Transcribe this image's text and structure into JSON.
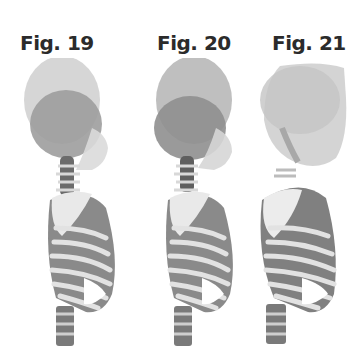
{
  "figures": [
    {
      "label": "Fig. 19",
      "skull_style": "two overlapping ovals, dark inner"
    },
    {
      "label": "Fig. 20",
      "skull_style": "two overlapping ovals, dark lower"
    },
    {
      "label": "Fig. 21",
      "skull_style": "faded, light gray skull"
    }
  ],
  "colors": {
    "skull_outer": "#c8c8c8",
    "skull_inner": "#9a9a9a",
    "skull_faded": "#d4d4d4",
    "bone_light": "#e6e6e6",
    "bone_dark": "#555555",
    "label": "#2b2b2b"
  }
}
